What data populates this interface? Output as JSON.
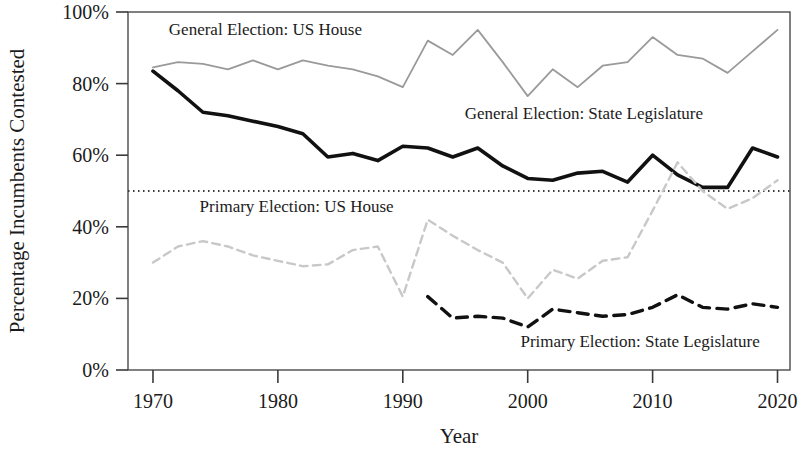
{
  "chart_data": {
    "type": "line",
    "title": "",
    "xlabel": "Year",
    "ylabel": "Percentage Incumbents Contested",
    "xlim": [
      1968,
      2021
    ],
    "ylim": [
      0,
      100
    ],
    "grid": false,
    "legend_position": "inline-annotations",
    "x_tick_labels": [
      "1970",
      "1980",
      "1990",
      "2000",
      "2010",
      "2020"
    ],
    "x_tick_values": [
      1970,
      1980,
      1990,
      2000,
      2010,
      2020
    ],
    "y_tick_labels": [
      "0%",
      "20%",
      "40%",
      "60%",
      "80%",
      "100%"
    ],
    "y_tick_values": [
      0,
      20,
      40,
      60,
      80,
      100
    ],
    "reference_line": {
      "name": "fifty-percent-reference-line",
      "value": 50,
      "style": "dotted",
      "color": "#3a3a3a"
    },
    "series": [
      {
        "name": "General Election: US House",
        "color": "#9a9a9a",
        "style": "solid",
        "width": 1.8,
        "x": [
          1970,
          1972,
          1974,
          1976,
          1978,
          1980,
          1982,
          1984,
          1986,
          1988,
          1990,
          1992,
          1994,
          1996,
          1998,
          2000,
          2002,
          2004,
          2006,
          2008,
          2010,
          2012,
          2014,
          2016,
          2018,
          2020
        ],
        "values": [
          84.5,
          86.0,
          85.5,
          84.0,
          86.5,
          84.0,
          86.5,
          85.0,
          84.0,
          82.0,
          79.0,
          92.0,
          88.0,
          95.0,
          86.0,
          76.5,
          84.0,
          79.0,
          85.0,
          86.0,
          93.0,
          88.0,
          87.0,
          83.0,
          89.0,
          95.0
        ]
      },
      {
        "name": "General Election: State Legislature",
        "color": "#111111",
        "style": "solid",
        "width": 3.6,
        "x": [
          1970,
          1972,
          1974,
          1976,
          1978,
          1980,
          1982,
          1984,
          1986,
          1988,
          1990,
          1992,
          1994,
          1996,
          1998,
          2000,
          2002,
          2004,
          2006,
          2008,
          2010,
          2012,
          2014,
          2016,
          2018,
          2020
        ],
        "values": [
          83.5,
          78.0,
          72.0,
          71.0,
          69.5,
          68.0,
          66.0,
          59.5,
          60.5,
          58.5,
          62.5,
          62.0,
          59.5,
          62.0,
          57.0,
          53.5,
          53.0,
          55.0,
          55.5,
          52.5,
          60.0,
          54.5,
          51.0,
          51.0,
          62.0,
          59.5
        ]
      },
      {
        "name": "Primary Election: US House",
        "color": "#c8c8c8",
        "style": "dashed",
        "width": 2.4,
        "x": [
          1970,
          1972,
          1974,
          1976,
          1978,
          1980,
          1982,
          1984,
          1986,
          1988,
          1990,
          1992,
          1994,
          1996,
          1998,
          2000,
          2002,
          2004,
          2006,
          2008,
          2010,
          2012,
          2014,
          2016,
          2018,
          2020
        ],
        "values": [
          30.0,
          34.5,
          36.0,
          34.5,
          32.0,
          30.5,
          29.0,
          29.5,
          33.5,
          34.5,
          20.5,
          42.0,
          37.5,
          33.5,
          30.0,
          20.0,
          28.0,
          25.5,
          30.5,
          31.5,
          44.5,
          58.0,
          50.0,
          45.0,
          48.0,
          53.0
        ]
      },
      {
        "name": "Primary Election: State Legislature",
        "color": "#111111",
        "style": "dashed",
        "width": 3.4,
        "x": [
          1992,
          1994,
          1996,
          1998,
          2000,
          2002,
          2004,
          2006,
          2008,
          2010,
          2012,
          2014,
          2016,
          2018,
          2020
        ],
        "values": [
          20.5,
          14.5,
          15.0,
          14.5,
          12.0,
          17.0,
          16.0,
          15.0,
          15.5,
          17.5,
          21.0,
          17.5,
          17.0,
          18.5,
          17.5
        ]
      }
    ],
    "annotations": [
      {
        "name": "label-general-us-house",
        "text": "General Election: US House",
        "x": 1979.0,
        "y": 93.5
      },
      {
        "name": "label-general-state-legislature",
        "text": "General Election: State Legislature",
        "x": 2004.5,
        "y": 70.0
      },
      {
        "name": "label-primary-us-house",
        "text": "Primary Election: US House",
        "x": 1981.5,
        "y": 44.0
      },
      {
        "name": "label-primary-state-legislature",
        "text": "Primary Election: State Legislature",
        "x": 2009.0,
        "y": 6.5
      }
    ]
  }
}
